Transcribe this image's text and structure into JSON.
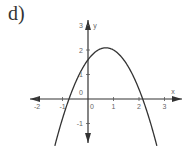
{
  "problem_label": "d)",
  "chart_data": {
    "type": "line",
    "title": "",
    "xlabel": "x",
    "ylabel": "y",
    "xlim": [
      -2.3,
      3.3
    ],
    "ylim": [
      -1.6,
      3.3
    ],
    "x_ticks": [
      "-2",
      "-1",
      "0",
      "1",
      "2",
      "3"
    ],
    "y_ticks": [
      "3",
      "2",
      "1",
      "0",
      "-1"
    ],
    "grid": false,
    "legend": null,
    "series": [
      {
        "name": "parabola",
        "equation": "y = -x^2 + 1.4x + 1.6",
        "vertex": [
          0.7,
          2.1
        ],
        "roots": [
          -0.74,
          2.14
        ],
        "y_intercept": 1.6,
        "x": [
          -1.3,
          -1.0,
          -0.74,
          -0.5,
          0,
          0.5,
          0.7,
          1.0,
          1.5,
          2.0,
          2.14,
          2.5,
          2.7
        ],
        "y": [
          -1.9,
          -0.8,
          0.0,
          0.65,
          1.6,
          2.05,
          2.1,
          2.0,
          1.45,
          0.4,
          0.0,
          -1.05,
          -1.81
        ]
      }
    ]
  },
  "axis_labels": {
    "x": "x",
    "y": "y"
  },
  "ticks": {
    "x": [
      {
        "v": -2,
        "t": "-2"
      },
      {
        "v": -1,
        "t": "-1"
      },
      {
        "v": 0,
        "t": "0"
      },
      {
        "v": 1,
        "t": "1"
      },
      {
        "v": 2,
        "t": "2"
      },
      {
        "v": 3,
        "t": "3"
      }
    ],
    "y": [
      {
        "v": 3,
        "t": "3"
      },
      {
        "v": 2,
        "t": "2"
      },
      {
        "v": 1,
        "t": "1"
      },
      {
        "v": -1,
        "t": "-1"
      }
    ],
    "origin_label": "0"
  }
}
